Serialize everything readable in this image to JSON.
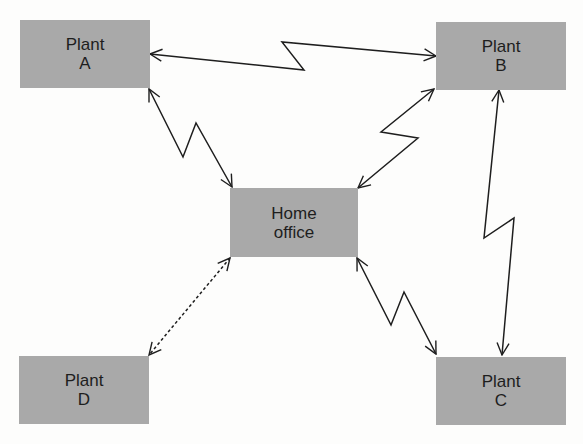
{
  "diagram": {
    "box_color": "#a9a9a9",
    "line_color": "#1e1e1e",
    "nodes": [
      {
        "id": "plant-a",
        "line1": "Plant",
        "line2": "A"
      },
      {
        "id": "plant-b",
        "line1": "Plant",
        "line2": "B"
      },
      {
        "id": "home-office",
        "line1": "Home",
        "line2": "office"
      },
      {
        "id": "plant-c",
        "line1": "Plant",
        "line2": "C"
      },
      {
        "id": "plant-d",
        "line1": "Plant",
        "line2": "D"
      }
    ],
    "links": [
      {
        "from": "Plant A",
        "to": "Plant B",
        "style": "zigzag",
        "direction": "bidirectional"
      },
      {
        "from": "Plant A",
        "to": "Home office",
        "style": "zigzag",
        "direction": "bidirectional"
      },
      {
        "from": "Plant B",
        "to": "Home office",
        "style": "zigzag",
        "direction": "bidirectional"
      },
      {
        "from": "Plant B",
        "to": "Plant C",
        "style": "zigzag",
        "direction": "bidirectional"
      },
      {
        "from": "Home office",
        "to": "Plant C",
        "style": "zigzag",
        "direction": "bidirectional"
      },
      {
        "from": "Home office",
        "to": "Plant D",
        "style": "dashed",
        "direction": "bidirectional"
      }
    ]
  }
}
